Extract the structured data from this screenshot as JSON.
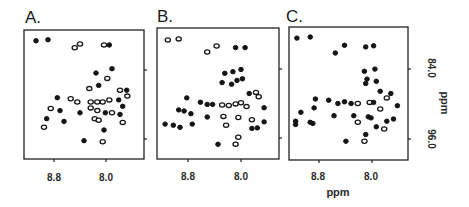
{
  "figure": {
    "background": "#ffffff",
    "ink": "#151515"
  },
  "chart_data": [
    {
      "type": "scatter",
      "panel": "A.",
      "title": "A.",
      "xlabel": "",
      "ylabel": "",
      "x_ticks": [
        "8.8",
        "8.0"
      ],
      "y_ticks": [
        "84.0",
        "96.0"
      ],
      "xlim": [
        9.2,
        7.4
      ],
      "ylim": [
        77.0,
        101.0
      ],
      "x_reversed": true,
      "y_reversed": true,
      "grid": false,
      "description": "2D NMR contour spectrum (HSQC-like), cross peaks",
      "points": [
        {
          "x": 9.02,
          "y": 79.0,
          "style": "filled"
        },
        {
          "x": 8.84,
          "y": 78.8,
          "style": "filled"
        },
        {
          "x": 8.44,
          "y": 80.3,
          "style": "open"
        },
        {
          "x": 8.36,
          "y": 79.6,
          "style": "open"
        },
        {
          "x": 8.0,
          "y": 79.8,
          "style": "open"
        },
        {
          "x": 7.92,
          "y": 79.8,
          "style": "filled"
        },
        {
          "x": 8.12,
          "y": 85.0,
          "style": "filled"
        },
        {
          "x": 7.88,
          "y": 84.2,
          "style": "filled"
        },
        {
          "x": 7.95,
          "y": 86.0,
          "style": "open"
        },
        {
          "x": 8.08,
          "y": 87.3,
          "style": "filled"
        },
        {
          "x": 8.22,
          "y": 87.9,
          "style": "open"
        },
        {
          "x": 7.76,
          "y": 88.2,
          "style": "open"
        },
        {
          "x": 7.66,
          "y": 88.2,
          "style": "filled"
        },
        {
          "x": 8.7,
          "y": 89.6,
          "style": "filled"
        },
        {
          "x": 8.5,
          "y": 89.8,
          "style": "open"
        },
        {
          "x": 8.4,
          "y": 90.4,
          "style": "open"
        },
        {
          "x": 8.2,
          "y": 90.4,
          "style": "open"
        },
        {
          "x": 8.1,
          "y": 90.4,
          "style": "open"
        },
        {
          "x": 8.02,
          "y": 90.4,
          "style": "open"
        },
        {
          "x": 7.92,
          "y": 90.0,
          "style": "open"
        },
        {
          "x": 7.78,
          "y": 90.0,
          "style": "filled"
        },
        {
          "x": 7.65,
          "y": 89.3,
          "style": "open"
        },
        {
          "x": 7.72,
          "y": 91.2,
          "style": "filled"
        },
        {
          "x": 8.8,
          "y": 91.6,
          "style": "open"
        },
        {
          "x": 8.66,
          "y": 92.0,
          "style": "filled"
        },
        {
          "x": 8.36,
          "y": 92.4,
          "style": "filled"
        },
        {
          "x": 8.2,
          "y": 91.5,
          "style": "open"
        },
        {
          "x": 8.1,
          "y": 92.0,
          "style": "open"
        },
        {
          "x": 7.98,
          "y": 92.4,
          "style": "filled"
        },
        {
          "x": 7.88,
          "y": 92.4,
          "style": "open"
        },
        {
          "x": 7.76,
          "y": 92.7,
          "style": "filled"
        },
        {
          "x": 8.86,
          "y": 93.5,
          "style": "filled"
        },
        {
          "x": 8.6,
          "y": 94.0,
          "style": "filled"
        },
        {
          "x": 8.14,
          "y": 93.5,
          "style": "open"
        },
        {
          "x": 8.08,
          "y": 93.8,
          "style": "open"
        },
        {
          "x": 7.72,
          "y": 94.2,
          "style": "open"
        },
        {
          "x": 8.9,
          "y": 95.1,
          "style": "open"
        },
        {
          "x": 8.0,
          "y": 95.6,
          "style": "filled"
        },
        {
          "x": 8.3,
          "y": 97.6,
          "style": "filled"
        },
        {
          "x": 8.02,
          "y": 97.8,
          "style": "open"
        }
      ]
    },
    {
      "type": "scatter",
      "panel": "B.",
      "title": "B.",
      "xlabel": "",
      "ylabel": "",
      "x_ticks": [
        "8.8",
        "8.0"
      ],
      "y_ticks": [
        "84.0",
        "96.0"
      ],
      "xlim": [
        9.2,
        7.4
      ],
      "ylim": [
        77.0,
        101.0
      ],
      "x_reversed": true,
      "y_reversed": true,
      "grid": false,
      "points": [
        {
          "x": 9.04,
          "y": 79.2,
          "style": "open"
        },
        {
          "x": 8.88,
          "y": 79.0,
          "style": "open"
        },
        {
          "x": 8.46,
          "y": 81.4,
          "style": "open"
        },
        {
          "x": 8.32,
          "y": 80.3,
          "style": "open"
        },
        {
          "x": 8.04,
          "y": 80.6,
          "style": "filled"
        },
        {
          "x": 7.9,
          "y": 80.6,
          "style": "filled"
        },
        {
          "x": 8.2,
          "y": 85.3,
          "style": "filled"
        },
        {
          "x": 8.08,
          "y": 85.0,
          "style": "filled"
        },
        {
          "x": 7.96,
          "y": 84.6,
          "style": "filled"
        },
        {
          "x": 8.24,
          "y": 87.0,
          "style": "filled"
        },
        {
          "x": 8.1,
          "y": 87.3,
          "style": "filled"
        },
        {
          "x": 8.02,
          "y": 86.6,
          "style": "filled"
        },
        {
          "x": 7.94,
          "y": 86.3,
          "style": "filled"
        },
        {
          "x": 7.84,
          "y": 89.0,
          "style": "filled"
        },
        {
          "x": 7.74,
          "y": 88.8,
          "style": "open"
        },
        {
          "x": 7.7,
          "y": 89.6,
          "style": "open"
        },
        {
          "x": 8.76,
          "y": 89.8,
          "style": "filled"
        },
        {
          "x": 8.56,
          "y": 90.6,
          "style": "filled"
        },
        {
          "x": 8.46,
          "y": 91.0,
          "style": "filled"
        },
        {
          "x": 8.38,
          "y": 91.0,
          "style": "filled"
        },
        {
          "x": 8.24,
          "y": 91.1,
          "style": "open"
        },
        {
          "x": 8.14,
          "y": 91.2,
          "style": "open"
        },
        {
          "x": 8.04,
          "y": 90.9,
          "style": "open"
        },
        {
          "x": 7.96,
          "y": 90.7,
          "style": "open"
        },
        {
          "x": 7.88,
          "y": 91.4,
          "style": "open"
        },
        {
          "x": 7.62,
          "y": 91.6,
          "style": "filled"
        },
        {
          "x": 8.88,
          "y": 92.0,
          "style": "filled"
        },
        {
          "x": 8.8,
          "y": 92.2,
          "style": "filled"
        },
        {
          "x": 8.7,
          "y": 92.7,
          "style": "filled"
        },
        {
          "x": 8.46,
          "y": 93.3,
          "style": "filled"
        },
        {
          "x": 8.22,
          "y": 93.2,
          "style": "open"
        },
        {
          "x": 8.0,
          "y": 93.4,
          "style": "open"
        },
        {
          "x": 7.8,
          "y": 93.8,
          "style": "open"
        },
        {
          "x": 7.62,
          "y": 94.2,
          "style": "filled"
        },
        {
          "x": 9.08,
          "y": 94.6,
          "style": "filled"
        },
        {
          "x": 8.96,
          "y": 94.8,
          "style": "filled"
        },
        {
          "x": 8.86,
          "y": 95.2,
          "style": "filled"
        },
        {
          "x": 8.68,
          "y": 94.6,
          "style": "filled"
        },
        {
          "x": 8.18,
          "y": 94.8,
          "style": "open"
        },
        {
          "x": 7.8,
          "y": 95.4,
          "style": "filled"
        },
        {
          "x": 7.72,
          "y": 95.3,
          "style": "filled"
        },
        {
          "x": 8.0,
          "y": 97.0,
          "style": "open"
        },
        {
          "x": 8.3,
          "y": 98.3,
          "style": "filled"
        },
        {
          "x": 8.04,
          "y": 98.3,
          "style": "open"
        }
      ]
    },
    {
      "type": "scatter",
      "panel": "C.",
      "title": "C.",
      "xlabel": "ppm",
      "ylabel": "ppm",
      "x_ticks": [
        "8.8",
        "8.0"
      ],
      "y_ticks": [
        "84.0",
        "96.0"
      ],
      "xlim": [
        9.2,
        7.4
      ],
      "ylim": [
        77.0,
        101.0
      ],
      "x_reversed": true,
      "y_reversed": true,
      "grid": false,
      "points": [
        {
          "x": 9.08,
          "y": 79.0,
          "style": "filled"
        },
        {
          "x": 8.88,
          "y": 78.8,
          "style": "filled"
        },
        {
          "x": 8.36,
          "y": 80.3,
          "style": "filled"
        },
        {
          "x": 8.5,
          "y": 81.7,
          "style": "filled"
        },
        {
          "x": 8.04,
          "y": 80.6,
          "style": "filled"
        },
        {
          "x": 7.92,
          "y": 80.4,
          "style": "filled"
        },
        {
          "x": 8.06,
          "y": 85.0,
          "style": "filled"
        },
        {
          "x": 7.9,
          "y": 84.6,
          "style": "filled"
        },
        {
          "x": 8.02,
          "y": 86.4,
          "style": "filled"
        },
        {
          "x": 8.04,
          "y": 87.2,
          "style": "filled"
        },
        {
          "x": 7.88,
          "y": 86.8,
          "style": "filled"
        },
        {
          "x": 7.82,
          "y": 88.6,
          "style": "filled"
        },
        {
          "x": 7.66,
          "y": 89.0,
          "style": "filled"
        },
        {
          "x": 7.72,
          "y": 89.8,
          "style": "open"
        },
        {
          "x": 8.8,
          "y": 90.0,
          "style": "filled"
        },
        {
          "x": 8.6,
          "y": 90.2,
          "style": "filled"
        },
        {
          "x": 8.46,
          "y": 90.8,
          "style": "filled"
        },
        {
          "x": 8.36,
          "y": 90.5,
          "style": "filled"
        },
        {
          "x": 8.26,
          "y": 90.8,
          "style": "filled"
        },
        {
          "x": 8.16,
          "y": 90.8,
          "style": "open"
        },
        {
          "x": 7.98,
          "y": 90.6,
          "style": "open"
        },
        {
          "x": 7.92,
          "y": 90.6,
          "style": "filled"
        },
        {
          "x": 7.56,
          "y": 91.2,
          "style": "filled"
        },
        {
          "x": 8.82,
          "y": 91.6,
          "style": "filled"
        },
        {
          "x": 9.02,
          "y": 92.4,
          "style": "filled"
        },
        {
          "x": 7.82,
          "y": 91.8,
          "style": "open"
        },
        {
          "x": 8.52,
          "y": 93.0,
          "style": "filled"
        },
        {
          "x": 8.22,
          "y": 93.0,
          "style": "filled"
        },
        {
          "x": 8.0,
          "y": 93.2,
          "style": "filled"
        },
        {
          "x": 7.96,
          "y": 93.4,
          "style": "filled"
        },
        {
          "x": 9.1,
          "y": 94.0,
          "style": "filled"
        },
        {
          "x": 9.1,
          "y": 94.6,
          "style": "filled"
        },
        {
          "x": 8.88,
          "y": 94.2,
          "style": "filled"
        },
        {
          "x": 8.84,
          "y": 94.4,
          "style": "filled"
        },
        {
          "x": 8.16,
          "y": 94.2,
          "style": "open"
        },
        {
          "x": 7.72,
          "y": 94.0,
          "style": "filled"
        },
        {
          "x": 7.62,
          "y": 93.6,
          "style": "filled"
        },
        {
          "x": 7.88,
          "y": 95.0,
          "style": "filled"
        },
        {
          "x": 7.76,
          "y": 95.4,
          "style": "open"
        },
        {
          "x": 8.04,
          "y": 96.4,
          "style": "filled"
        },
        {
          "x": 8.34,
          "y": 97.6,
          "style": "filled"
        },
        {
          "x": 8.06,
          "y": 97.6,
          "style": "open"
        }
      ]
    }
  ],
  "panels": [
    {
      "label": "A.",
      "x_tick_1": "8.8",
      "x_tick_2": "8.0"
    },
    {
      "label": "B.",
      "x_tick_1": "8.8",
      "x_tick_2": "8.0"
    },
    {
      "label": "C.",
      "x_tick_1": "8.8",
      "x_tick_2": "8.0"
    }
  ],
  "axes": {
    "x_title": "ppm",
    "y_title": "ppm",
    "y_tick_top": "84.0",
    "y_tick_bottom": "96.0"
  }
}
